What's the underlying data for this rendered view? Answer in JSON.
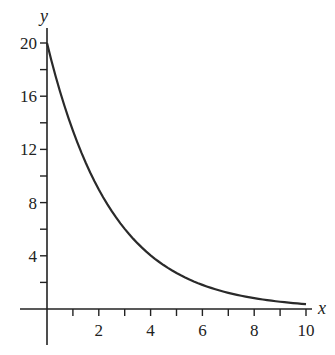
{
  "chart_data": {
    "type": "line",
    "title": "",
    "xlabel": "x",
    "ylabel": "y",
    "xlim": [
      0,
      10
    ],
    "ylim": [
      0,
      20
    ],
    "grid": false,
    "legend": null,
    "x_ticks": [
      1,
      2,
      3,
      4,
      5,
      6,
      7,
      8,
      9,
      10
    ],
    "x_tick_labels": [
      "2",
      "4",
      "6",
      "8",
      "10"
    ],
    "x_labeled_values": [
      2,
      4,
      6,
      8,
      10
    ],
    "y_ticks": [
      2,
      4,
      6,
      8,
      10,
      12,
      14,
      16,
      18,
      20
    ],
    "y_tick_labels": [
      "4",
      "8",
      "12",
      "16",
      "20"
    ],
    "y_labeled_values": [
      4,
      8,
      12,
      16,
      20
    ],
    "series": [
      {
        "name": "y = 20e^(-0.4x)",
        "x": [
          0,
          1,
          2,
          3,
          4,
          5,
          6,
          7,
          8,
          9,
          10
        ],
        "values": [
          20,
          13.41,
          8.99,
          6.02,
          4.04,
          2.71,
          1.81,
          1.22,
          0.82,
          0.55,
          0.37
        ]
      }
    ],
    "function": {
      "a": 20,
      "k": 0.4,
      "samples": 60
    }
  },
  "colors": {
    "axis": "#222222",
    "curve": "#2a2a2a",
    "background": "#ffffff"
  }
}
